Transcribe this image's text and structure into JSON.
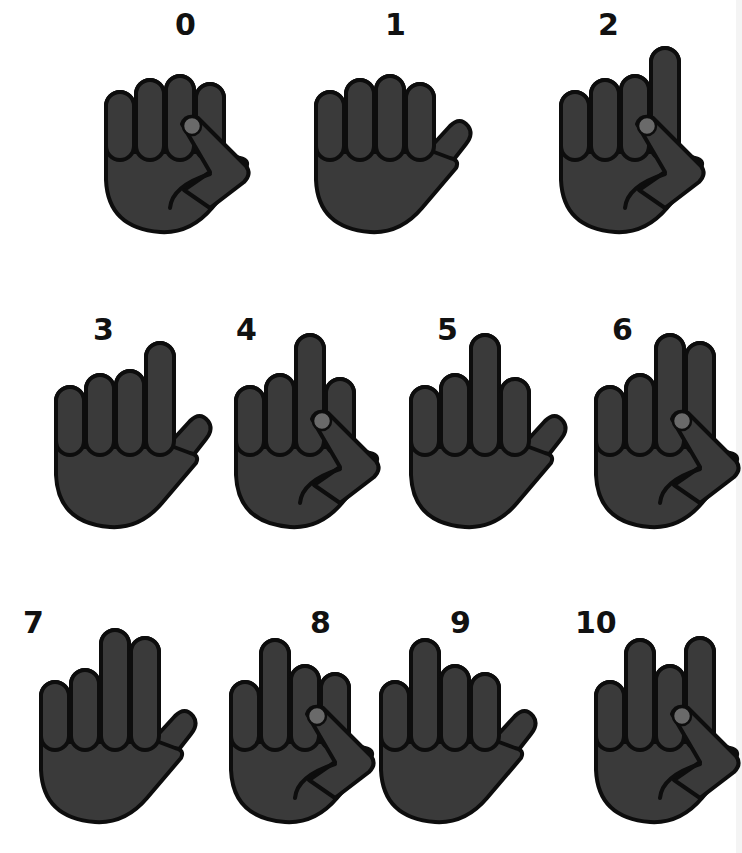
{
  "colors": {
    "fill": "#3a3a3a",
    "stroke": "#0d0d0d",
    "nail": "#6a6a6a",
    "background": "#ffffff"
  },
  "gestures": [
    {
      "label": "0",
      "x": 100,
      "y": 40,
      "label_dx": 75,
      "label_dy": 0,
      "fingers": [
        0,
        0,
        0,
        0
      ],
      "thumb": "tucked"
    },
    {
      "label": "1",
      "x": 310,
      "y": 40,
      "label_dx": 75,
      "label_dy": 0,
      "fingers": [
        0,
        0,
        0,
        0
      ],
      "thumb": "out"
    },
    {
      "label": "2",
      "x": 555,
      "y": 40,
      "label_dx": 43,
      "label_dy": 0,
      "fingers": [
        0,
        0,
        0,
        1
      ],
      "thumb": "tucked"
    },
    {
      "label": "3",
      "x": 50,
      "y": 335,
      "label_dx": 43,
      "label_dy": 10,
      "fingers": [
        0,
        0,
        0,
        1
      ],
      "thumb": "out"
    },
    {
      "label": "4",
      "x": 230,
      "y": 335,
      "label_dx": 6,
      "label_dy": 10,
      "fingers": [
        0,
        0,
        1,
        0
      ],
      "thumb": "tucked"
    },
    {
      "label": "5",
      "x": 405,
      "y": 335,
      "label_dx": 32,
      "label_dy": 10,
      "fingers": [
        0,
        0,
        1,
        0
      ],
      "thumb": "out"
    },
    {
      "label": "6",
      "x": 590,
      "y": 335,
      "label_dx": 22,
      "label_dy": 10,
      "fingers": [
        0,
        0,
        1,
        1
      ],
      "thumb": "tucked"
    },
    {
      "label": "7",
      "x": 35,
      "y": 630,
      "label_dx": -12,
      "label_dy": 8,
      "fingers": [
        0,
        0,
        1,
        1
      ],
      "thumb": "out"
    },
    {
      "label": "8",
      "x": 225,
      "y": 630,
      "label_dx": 85,
      "label_dy": 8,
      "fingers": [
        0,
        1,
        0,
        0
      ],
      "thumb": "tucked"
    },
    {
      "label": "9",
      "x": 375,
      "y": 630,
      "label_dx": 75,
      "label_dy": 8,
      "fingers": [
        0,
        1,
        0,
        0
      ],
      "thumb": "out"
    },
    {
      "label": "10",
      "x": 590,
      "y": 630,
      "label_dx": -15,
      "label_dy": 8,
      "fingers": [
        0,
        1,
        0,
        1
      ],
      "thumb": "tucked"
    }
  ]
}
